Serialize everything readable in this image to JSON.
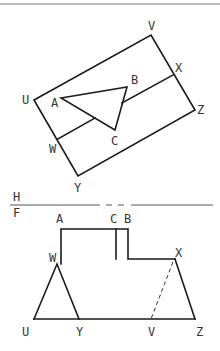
{
  "diagram": {
    "type": "orthographic projection / auxiliary view",
    "colors": {
      "line": "#1a1a1a",
      "label": "#333333",
      "rule": "#555555",
      "top_bar": "#777777"
    },
    "top_view": {
      "labels": {
        "U": "U",
        "V": "V",
        "X": "X",
        "Z": "Z",
        "W": "W",
        "Y": "Y",
        "A": "A",
        "B": "B",
        "C": "C"
      },
      "rectangle": {
        "U": [
          34,
          100
        ],
        "V": [
          151,
          35
        ],
        "Z": [
          195,
          110
        ],
        "bottom": [
          78,
          176
        ]
      },
      "divider": {
        "W": [
          58,
          139
        ],
        "X": [
          173,
          75
        ]
      },
      "triangle": {
        "A": [
          61,
          98
        ],
        "B": [
          127,
          87
        ],
        "C": [
          115,
          130
        ]
      }
    },
    "fold_line": {
      "upper_label": "H",
      "lower_label": "F",
      "y": 205
    },
    "front_view": {
      "labels": {
        "A": "A",
        "C": "C",
        "B": "B",
        "W": "W",
        "X": "X",
        "U": "U",
        "Y": "Y",
        "V": "V",
        "Z": "Z"
      },
      "points": {
        "A": [
          61,
          229
        ],
        "B": [
          128,
          229
        ],
        "C_top": [
          116,
          229
        ],
        "C_bottom": [
          116,
          259
        ],
        "W": [
          57,
          264
        ],
        "X": [
          175,
          259
        ],
        "U": [
          34,
          319
        ],
        "Y": [
          79,
          319
        ],
        "V": [
          151,
          319
        ],
        "Z": [
          195,
          319
        ]
      },
      "hidden_edges": [
        [
          "X",
          "V"
        ]
      ]
    }
  }
}
